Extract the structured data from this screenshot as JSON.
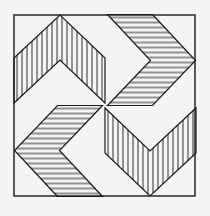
{
  "figure": {
    "background": "#f4f4f2",
    "stroke": "#1a1a1a",
    "hatch": "vertical lines",
    "fold_symmetry": 4
  }
}
